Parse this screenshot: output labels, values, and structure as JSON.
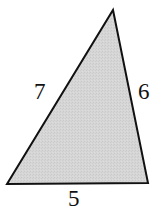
{
  "figure": {
    "kind": "geometry-diagram",
    "shape": "triangle",
    "canvas": {
      "width": 157,
      "height": 211
    },
    "background_color": "#ffffff",
    "fill_color": "#d4d4d4",
    "fill_texture": "stippled-halftone",
    "stroke_color": "#111111",
    "stroke_width": 2,
    "vertices": [
      {
        "name": "apex",
        "x": 113,
        "y": 10
      },
      {
        "name": "bottom-right",
        "x": 148,
        "y": 183
      },
      {
        "name": "bottom-left",
        "x": 7,
        "y": 184
      }
    ],
    "sides": [
      {
        "name": "left-side",
        "label": "7",
        "from": "bottom-left",
        "to": "apex"
      },
      {
        "name": "right-side",
        "label": "6",
        "from": "apex",
        "to": "bottom-right"
      },
      {
        "name": "bottom-side",
        "label": "5",
        "from": "bottom-left",
        "to": "bottom-right"
      }
    ],
    "labels": {
      "left": "7",
      "right": "6",
      "bottom": "5"
    }
  }
}
